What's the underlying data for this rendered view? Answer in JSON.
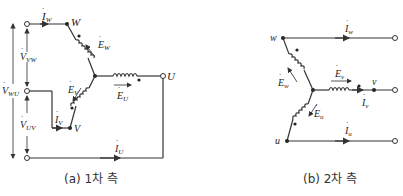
{
  "primary": {
    "caption": "(a) 1차 측",
    "terminals": {
      "U": "U",
      "V": "V",
      "W": "W"
    },
    "currents": {
      "I_W": {
        "main": "I",
        "sub": "W"
      },
      "I_V": {
        "main": "I",
        "sub": "V"
      },
      "I_U": {
        "main": "I",
        "sub": "U"
      }
    },
    "emfs": {
      "E_W": {
        "main": "E",
        "sub": "W"
      },
      "E_V": {
        "main": "E",
        "sub": "V"
      },
      "E_U": {
        "main": "E",
        "sub": "U"
      }
    },
    "voltages": {
      "V_VW": {
        "main": "V",
        "sub": "VW"
      },
      "V_WU": {
        "main": "V",
        "sub": "WU"
      },
      "V_UV": {
        "main": "V",
        "sub": "UV"
      }
    }
  },
  "secondary": {
    "caption": "(b) 2차 측",
    "terminals": {
      "u": "u",
      "v": "v",
      "w": "w"
    },
    "currents": {
      "I_w": {
        "main": "I",
        "sub": "w"
      },
      "I_v": {
        "main": "I",
        "sub": "v"
      },
      "I_u": {
        "main": "I",
        "sub": "u"
      }
    },
    "emfs": {
      "E_w": {
        "main": "E",
        "sub": "w"
      },
      "E_u": {
        "main": "E",
        "sub": "u"
      },
      "E_v": {
        "main": "E",
        "sub": "v"
      }
    }
  },
  "colors": {
    "line": "#333333",
    "background": "#ffffff"
  }
}
